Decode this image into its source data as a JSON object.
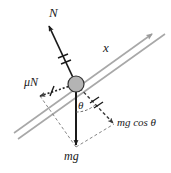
{
  "figure": {
    "background_color": "#ffffff",
    "width": 171,
    "height": 173,
    "colors": {
      "incline_line": "#a8a8a8",
      "vector_solid": "#1a1a1a",
      "vector_dashed": "#555555",
      "block_fill": "#b4b4b4",
      "block_stroke": "#333333",
      "label_text": "#1a1a1a"
    }
  },
  "labels": {
    "normal_force": "N",
    "axis_x": "x",
    "friction_force": "μN",
    "angle": "θ",
    "weight_component": "mg cos θ",
    "weight": "mg"
  },
  "vectors": [
    {
      "name": "normal-force",
      "label": "N",
      "style": "solid",
      "tick_marks": 2,
      "direction": "up-left, perpendicular to incline",
      "from": [
        76,
        84
      ],
      "to": [
        48,
        24
      ]
    },
    {
      "name": "friction-force",
      "label": "μN",
      "style": "dotted",
      "tick_marks": 1,
      "direction": "down-left, along incline",
      "from": [
        76,
        84
      ],
      "to": [
        38,
        97
      ]
    },
    {
      "name": "weight",
      "label": "mg",
      "style": "solid",
      "tick_marks": 0,
      "direction": "straight down",
      "from": [
        76,
        84
      ],
      "to": [
        76,
        147
      ]
    },
    {
      "name": "weight-normal-component",
      "label": "mg cos θ",
      "style": "dashed",
      "tick_marks": 2,
      "direction": "down-right, perpendicular to incline",
      "from": [
        76,
        84
      ],
      "to": [
        114,
        124
      ]
    }
  ],
  "incline": {
    "name": "inclined-plane",
    "style": "double-line with arrowhead",
    "arrow_end": "upper-right",
    "axis_label": "x"
  },
  "block": {
    "name": "block-on-incline",
    "shape": "circle",
    "center": [
      76,
      84
    ],
    "radius": 8
  },
  "angle_arc": {
    "name": "angle-theta",
    "label": "θ",
    "between": [
      "weight",
      "weight-normal-component"
    ]
  }
}
